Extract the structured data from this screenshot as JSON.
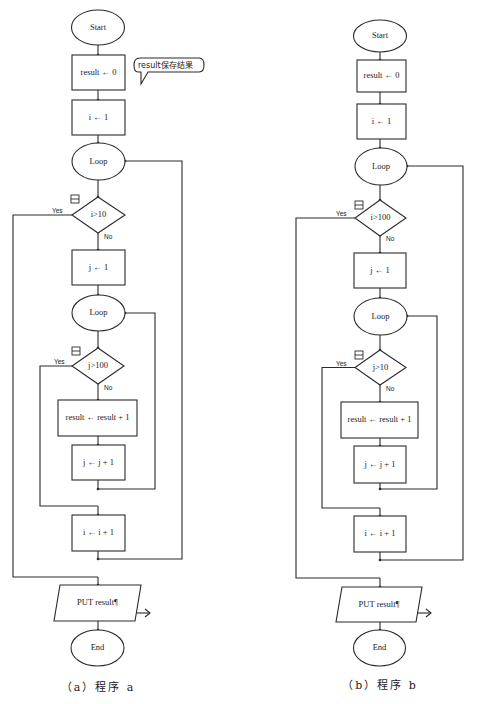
{
  "panels": [
    {
      "id": "a",
      "caption": "（a）程序 a",
      "start": "Start",
      "init_result": "result ← 0",
      "comment": "result保存结果",
      "init_i": "i ← 1",
      "outer_loop": "Loop",
      "outer_cond": "i>10",
      "init_j": "j ← 1",
      "inner_loop": "Loop",
      "inner_cond": "j>100",
      "body": "result ← result + 1",
      "inc_j": "j ← j + 1",
      "inc_i": "i ← i + 1",
      "output": "PUT result¶",
      "end": "End",
      "yes_label": "Yes",
      "no_label": "No"
    },
    {
      "id": "b",
      "caption": "（b）程序 b",
      "start": "Start",
      "init_result": "result ← 0",
      "init_i": "i ← 1",
      "outer_loop": "Loop",
      "outer_cond": "i>100",
      "init_j": "j ← 1",
      "inner_loop": "Loop",
      "inner_cond": "j>10",
      "body": "result ← result + 1",
      "inc_j": "j ← j + 1",
      "inc_i": "i ← i + 1",
      "output": "PUT result¶",
      "end": "End",
      "yes_label": "Yes",
      "no_label": "No"
    }
  ],
  "colors": {
    "line": "#2a2a2a",
    "text": "#1a1a1a",
    "background": "#ffffff"
  }
}
